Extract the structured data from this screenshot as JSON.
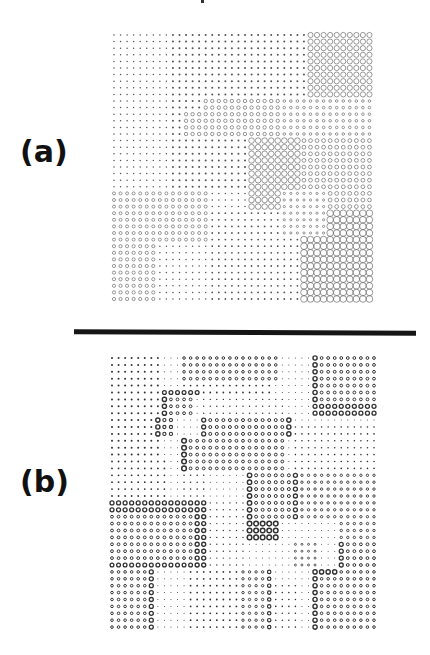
{
  "figure": {
    "panels": [
      {
        "label": "(a)",
        "label_letter": "a",
        "label_pos": {
          "x": 20,
          "y": 137
        },
        "grid": {
          "cols": 40,
          "rows": 41,
          "origin": {
            "x": 114,
            "y": 35
          },
          "step": {
            "x": 6.55,
            "y": 6.6
          },
          "stroke": "#555555",
          "default": {
            "type": "dot",
            "r": 0.75
          },
          "regions": [
            {
              "c": [
                9,
                29
              ],
              "r": [
                0,
                15
              ],
              "type": "dot",
              "r_": 1.0
            },
            {
              "c": [
                9,
                20
              ],
              "r": [
                16,
                23
              ],
              "type": "dot",
              "r_": 1.0
            },
            {
              "c": [
                15,
                28
              ],
              "r": [
                27,
                40
              ],
              "type": "dot",
              "r_": 0.9
            },
            {
              "c": [
                30,
                39
              ],
              "r": [
                0,
                9
              ],
              "type": "circle",
              "r_": 2.6,
              "sw": 0.6
            },
            {
              "c": [
                14,
                25
              ],
              "r": [
                10,
                11
              ],
              "type": "circle",
              "r_": 1.7,
              "sw": 0.6
            },
            {
              "c": [
                11,
                25
              ],
              "r": [
                12,
                15
              ],
              "type": "circle",
              "r_": 1.7,
              "sw": 0.6
            },
            {
              "c": [
                26,
                39
              ],
              "r": [
                10,
                15
              ],
              "type": "circle",
              "r_": 1.3,
              "sw": 0.6
            },
            {
              "c": [
                21,
                28
              ],
              "r": [
                16,
                26
              ],
              "type": "circle",
              "r_": 2.8,
              "sw": 0.6
            },
            {
              "c": [
                29,
                39
              ],
              "r": [
                16,
                23
              ],
              "type": "circle",
              "r_": 1.9,
              "sw": 0.6
            },
            {
              "c": [
                26,
                32
              ],
              "r": [
                24,
                26
              ],
              "type": "circle",
              "r_": 1.1,
              "sw": 0.6
            },
            {
              "c": [
                33,
                39
              ],
              "r": [
                24,
                26
              ],
              "type": "circle",
              "r_": 1.9,
              "sw": 0.6
            },
            {
              "c": [
                26,
                32
              ],
              "r": [
                27,
                30
              ],
              "type": "circle",
              "r_": 1.1,
              "sw": 0.6
            },
            {
              "c": [
                0,
                14
              ],
              "r": [
                24,
                31
              ],
              "type": "circle",
              "r_": 1.5,
              "sw": 0.6
            },
            {
              "c": [
                0,
                6
              ],
              "r": [
                32,
                40
              ],
              "type": "circle",
              "r_": 1.6,
              "sw": 0.6
            },
            {
              "c": [
                33,
                39
              ],
              "r": [
                27,
                30
              ],
              "type": "circle",
              "r_": 3.3,
              "sw": 0.6
            },
            {
              "c": [
                29,
                39
              ],
              "r": [
                31,
                40
              ],
              "type": "circle",
              "r_": 3.3,
              "sw": 0.6
            }
          ]
        }
      },
      {
        "label": "(b)",
        "label_letter": "b",
        "label_pos": {
          "x": 20,
          "y": 467
        },
        "grid": {
          "cols": 41,
          "rows": 40,
          "origin": {
            "x": 112,
            "y": 358
          },
          "step": {
            "x": 6.55,
            "y": 6.9
          },
          "stroke": "#333333",
          "default": {
            "type": "dot",
            "r": 0.5
          },
          "regions": [
            {
              "c": [
                0,
                7
              ],
              "r": [
                0,
                20
              ],
              "type": "dot",
              "r_": 1.0
            },
            {
              "c": [
                0,
                8
              ],
              "r": [
                15,
                20
              ],
              "type": "dot",
              "r_": 0.9
            },
            {
              "c": [
                11,
                25
              ],
              "r": [
                0,
                3
              ],
              "type": "circle",
              "r_": 1.3,
              "sw": 1.0
            },
            {
              "c": [
                11,
                24
              ],
              "r": [
                4,
                5
              ],
              "type": "dot",
              "r_": 0.9
            },
            {
              "c": [
                14,
                26
              ],
              "r": [
                6,
                8
              ],
              "type": "dot",
              "r_": 0.7
            },
            {
              "c": [
                31,
                40
              ],
              "r": [
                0,
                6
              ],
              "type": "circle",
              "r_": 1.4,
              "sw": 1.0
            },
            {
              "c": [
                31,
                31
              ],
              "r": [
                0,
                8
              ],
              "type": "circle",
              "r_": 2.1,
              "sw": 1.4
            },
            {
              "c": [
                31,
                40
              ],
              "r": [
                7,
                8
              ],
              "type": "circle",
              "r_": 2.0,
              "sw": 1.3
            },
            {
              "c": [
                8,
                13
              ],
              "r": [
                5,
                5
              ],
              "type": "circle",
              "r_": 1.9,
              "sw": 1.3
            },
            {
              "c": [
                8,
                12
              ],
              "r": [
                6,
                8
              ],
              "type": "circle",
              "r_": 1.4,
              "sw": 1.0
            },
            {
              "c": [
                8,
                8
              ],
              "r": [
                6,
                8
              ],
              "type": "circle",
              "r_": 2.1,
              "sw": 1.4
            },
            {
              "c": [
                7,
                9
              ],
              "r": [
                9,
                11
              ],
              "type": "circle",
              "r_": 1.6,
              "sw": 1.1
            },
            {
              "c": [
                7,
                7
              ],
              "r": [
                9,
                11
              ],
              "type": "circle",
              "r_": 2.1,
              "sw": 1.4
            },
            {
              "c": [
                14,
                27
              ],
              "r": [
                9,
                11
              ],
              "type": "circle",
              "r_": 1.5,
              "sw": 1.0
            },
            {
              "c": [
                14,
                14
              ],
              "r": [
                9,
                11
              ],
              "type": "circle",
              "r_": 2.0,
              "sw": 1.3
            },
            {
              "c": [
                27,
                27
              ],
              "r": [
                9,
                11
              ],
              "type": "circle",
              "r_": 2.1,
              "sw": 1.4
            },
            {
              "c": [
                28,
                40
              ],
              "r": [
                10,
                16
              ],
              "type": "dot",
              "r_": 0.8
            },
            {
              "c": [
                11,
                26
              ],
              "r": [
                12,
                16
              ],
              "type": "circle",
              "r_": 1.4,
              "sw": 1.0
            },
            {
              "c": [
                11,
                11
              ],
              "r": [
                12,
                16
              ],
              "type": "circle",
              "r_": 2.3,
              "sw": 1.5
            },
            {
              "c": [
                11,
                14
              ],
              "r": [
                17,
                20
              ],
              "type": "dot",
              "r_": 0.8
            },
            {
              "c": [
                21,
                28
              ],
              "r": [
                17,
                23
              ],
              "type": "circle",
              "r_": 1.5,
              "sw": 1.0
            },
            {
              "c": [
                21,
                21
              ],
              "r": [
                17,
                23
              ],
              "type": "circle",
              "r_": 2.2,
              "sw": 1.4
            },
            {
              "c": [
                28,
                28
              ],
              "r": [
                17,
                23
              ],
              "type": "circle",
              "r_": 2.0,
              "sw": 1.3
            },
            {
              "c": [
                29,
                40
              ],
              "r": [
                17,
                23
              ],
              "type": "circle",
              "r_": 1.2,
              "sw": 0.9
            },
            {
              "c": [
                0,
                14
              ],
              "r": [
                21,
                30
              ],
              "type": "circle",
              "r_": 1.4,
              "sw": 1.0
            },
            {
              "c": [
                0,
                14
              ],
              "r": [
                21,
                22
              ],
              "type": "circle",
              "r_": 2.0,
              "sw": 1.3
            },
            {
              "c": [
                13,
                14
              ],
              "r": [
                21,
                30
              ],
              "type": "circle",
              "r_": 2.0,
              "sw": 1.4
            },
            {
              "c": [
                0,
                12
              ],
              "r": [
                30,
                30
              ],
              "type": "circle",
              "r_": 1.9,
              "sw": 1.3
            },
            {
              "c": [
                15,
                20
              ],
              "r": [
                21,
                30
              ],
              "type": "dot",
              "r_": 0.7
            },
            {
              "c": [
                21,
                25
              ],
              "r": [
                24,
                26
              ],
              "type": "circle",
              "r_": 2.3,
              "sw": 1.5
            },
            {
              "c": [
                35,
                40
              ],
              "r": [
                24,
                26
              ],
              "type": "circle",
              "r_": 1.2,
              "sw": 0.9
            },
            {
              "c": [
                28,
                31
              ],
              "r": [
                27,
                30
              ],
              "type": "circle",
              "r_": 1.0,
              "sw": 0.8
            },
            {
              "c": [
                35,
                40
              ],
              "r": [
                27,
                30
              ],
              "type": "circle",
              "r_": 1.4,
              "sw": 1.0
            },
            {
              "c": [
                35,
                35
              ],
              "r": [
                27,
                30
              ],
              "type": "circle",
              "r_": 2.0,
              "sw": 1.3
            },
            {
              "c": [
                0,
                6
              ],
              "r": [
                31,
                39
              ],
              "type": "circle",
              "r_": 1.3,
              "sw": 1.0
            },
            {
              "c": [
                6,
                6
              ],
              "r": [
                31,
                39
              ],
              "type": "circle",
              "r_": 2.0,
              "sw": 1.3
            },
            {
              "c": [
                12,
                23
              ],
              "r": [
                31,
                39
              ],
              "type": "dot",
              "r_": 0.9
            },
            {
              "c": [
                20,
                24
              ],
              "r": [
                31,
                39
              ],
              "type": "circle",
              "r_": 1.2,
              "sw": 0.9
            },
            {
              "c": [
                24,
                24
              ],
              "r": [
                31,
                39
              ],
              "type": "circle",
              "r_": 1.7,
              "sw": 1.2
            },
            {
              "c": [
                25,
                28
              ],
              "r": [
                33,
                39
              ],
              "type": "dot",
              "r_": 0.8
            },
            {
              "c": [
                31,
                40
              ],
              "r": [
                31,
                39
              ],
              "type": "circle",
              "r_": 1.3,
              "sw": 1.0
            },
            {
              "c": [
                31,
                34
              ],
              "r": [
                31,
                31
              ],
              "type": "circle",
              "r_": 2.1,
              "sw": 1.4
            },
            {
              "c": [
                31,
                31
              ],
              "r": [
                31,
                39
              ],
              "type": "circle",
              "r_": 2.1,
              "sw": 1.4
            }
          ]
        }
      }
    ],
    "divider": {
      "color": "#151515"
    }
  }
}
